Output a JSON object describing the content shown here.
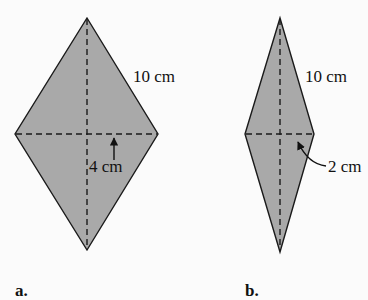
{
  "figures": [
    {
      "id": "a",
      "caption": "a.",
      "side_label": "10 cm",
      "diagonal_label": "4 cm",
      "shape": "rhombus",
      "fill_color": "#a9a9a9",
      "stroke_color": "#1a1a1a"
    },
    {
      "id": "b",
      "caption": "b.",
      "side_label": "10 cm",
      "diagonal_label": "2 cm",
      "shape": "rhombus",
      "fill_color": "#a9a9a9",
      "stroke_color": "#1a1a1a"
    }
  ]
}
